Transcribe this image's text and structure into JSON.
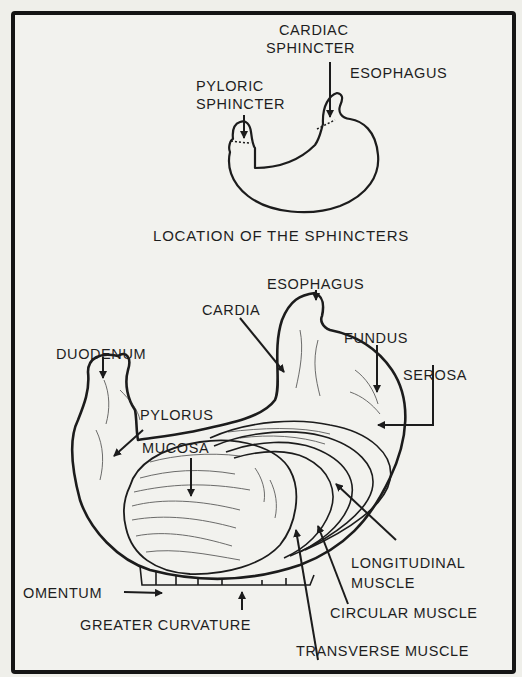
{
  "figure": {
    "top_panel": {
      "caption": "LOCATION OF THE SPHINCTERS",
      "labels": {
        "cardiac_sphincter_line1": "CARDIAC",
        "cardiac_sphincter_line2": "SPHINCTER",
        "esophagus": "ESOPHAGUS",
        "pyloric_sphincter_line1": "PYLORIC",
        "pyloric_sphincter_line2": "SPHINCTER"
      }
    },
    "bottom_panel": {
      "labels": {
        "esophagus": "ESOPHAGUS",
        "cardia": "CARDIA",
        "fundus": "FUNDUS",
        "duodenum": "DUODENUM",
        "serosa": "SEROSA",
        "pylorus": "PYLORUS",
        "mucosa": "MUCOSA",
        "longitudinal_muscle_line1": "LONGITUDINAL",
        "longitudinal_muscle_line2": "MUSCLE",
        "omentum": "OMENTUM",
        "circular_muscle": "CIRCULAR MUSCLE",
        "greater_curvature": "GREATER CURVATURE",
        "transverse_muscle": "TRANSVERSE MUSCLE"
      }
    },
    "colors": {
      "ink": "#1c1c1c",
      "paper": "#f2f2ee",
      "border": "#151515"
    }
  }
}
